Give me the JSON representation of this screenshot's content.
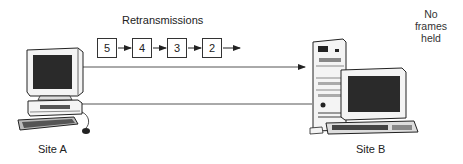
{
  "diagram": {
    "title": "Retransmissions",
    "frames": [
      {
        "id": "frame-5",
        "label": "5"
      },
      {
        "id": "frame-4",
        "label": "4"
      },
      {
        "id": "frame-3",
        "label": "3"
      },
      {
        "id": "frame-2",
        "label": "2"
      }
    ],
    "site_a": {
      "label": "Site A"
    },
    "site_b": {
      "label": "Site B"
    },
    "note": {
      "line1": "No",
      "line2": "frames",
      "line3": "held"
    },
    "colors": {
      "line": "#555555",
      "ink": "#222222",
      "screen": "#2a2a2a",
      "case": "#f4f4f4"
    }
  }
}
